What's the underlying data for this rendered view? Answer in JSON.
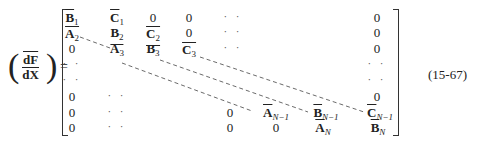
{
  "lhs": {
    "numerator": "dF",
    "denominator": "dX",
    "equals": "=",
    "open_paren": "(",
    "close_paren": ")"
  },
  "equation_number": "(15-67)",
  "matrix": {
    "rows": [
      [
        "B̄1",
        "C̄1",
        "0",
        "0",
        "··",
        "",
        "",
        "0"
      ],
      [
        "A2",
        "B̲2",
        "C̲2",
        "0",
        "··",
        "",
        "",
        "0"
      ],
      [
        "0",
        "A3",
        "B3",
        "C̄3",
        "··",
        "",
        "",
        "0"
      ],
      [
        "··",
        "",
        "",
        "",
        "",
        "",
        "",
        "··"
      ],
      [
        "··",
        "",
        "",
        "",
        "",
        "",
        "",
        "··"
      ],
      [
        "0",
        "··",
        "",
        "",
        "",
        "",
        "",
        "0"
      ],
      [
        "0",
        "··",
        "",
        "",
        "0",
        "ĀN-1",
        "B̄N-1",
        "C̄N-1"
      ],
      [
        "0",
        "··",
        "",
        "",
        "0",
        "0",
        "ĀN",
        "B̄N"
      ]
    ]
  },
  "cells": {
    "r1c1": {
      "base": "B",
      "sub": "1"
    },
    "r1c2": {
      "base": "C",
      "sub": "1"
    },
    "r1c3": "0",
    "r1c4": "0",
    "r1c5": "· ·",
    "r1c8": "0",
    "r2c1": {
      "base": "A",
      "sub": "2"
    },
    "r2c2": {
      "base": "B",
      "sub": "2"
    },
    "r2c3": {
      "base": "C",
      "sub": "2"
    },
    "r2c4": "0",
    "r2c5": "· ·",
    "r2c8": "0",
    "r3c1": "0",
    "r3c2": {
      "base": "A",
      "sub": "3"
    },
    "r3c3": {
      "base": "B",
      "sub": "3"
    },
    "r3c4": {
      "base": "C",
      "sub": "3"
    },
    "r3c5": "· ·",
    "r3c8": "0",
    "r4c1": "· ·",
    "r4c8": "· ·",
    "r5c1": "· ·",
    "r5c8": "· ·",
    "r6c1": "0",
    "r6c2": "· ·",
    "r6c8": "0",
    "r7c1": "0",
    "r7c2": "· ·",
    "r7c5": "0",
    "r7c6": {
      "base": "A",
      "sub": "N−1"
    },
    "r7c7": {
      "base": "B",
      "sub": "N−1"
    },
    "r7c8": {
      "base": "C",
      "sub": "N−1"
    },
    "r8c1": "0",
    "r8c2": "· ·",
    "r8c5": "0",
    "r8c6": "0",
    "r8c7": {
      "base": "A",
      "sub": "N"
    },
    "r8c8": {
      "base": "B",
      "sub": "N"
    }
  }
}
